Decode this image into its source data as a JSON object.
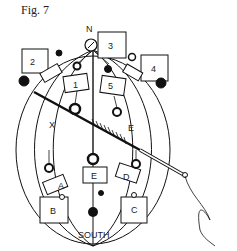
{
  "figure": {
    "title": "Fig. 7",
    "labels": {
      "north": "N",
      "south": "SOUTH",
      "x": "X",
      "e_upper": "E"
    },
    "boxes": [
      {
        "id": "box-1",
        "label": "1"
      },
      {
        "id": "box-2",
        "label": "2"
      },
      {
        "id": "box-3",
        "label": "3"
      },
      {
        "id": "box-4",
        "label": "4"
      },
      {
        "id": "box-5",
        "label": "5"
      },
      {
        "id": "box-a",
        "label": "A"
      },
      {
        "id": "box-b",
        "label": "B"
      },
      {
        "id": "box-c",
        "label": "C"
      },
      {
        "id": "box-d",
        "label": "D"
      },
      {
        "id": "box-e",
        "label": "E"
      }
    ]
  }
}
